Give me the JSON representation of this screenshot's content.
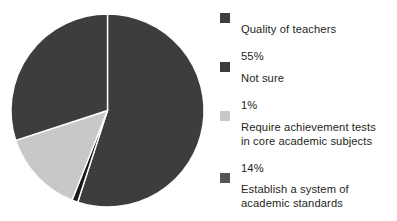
{
  "chart_data": {
    "type": "pie",
    "title": "",
    "subtitle": "",
    "xlabel": "",
    "ylabel": "",
    "legend_position": "right",
    "grid": false,
    "start_angle_deg": 0,
    "direction": "clockwise",
    "categories": [
      "Quality of teachers",
      "Not sure",
      "Require achievement tests in core academic subjects",
      "Establish a system of academic standards"
    ],
    "values": [
      55,
      1,
      14,
      30
    ],
    "value_labels": [
      "55%",
      "1%",
      "14%",
      "30%"
    ],
    "unit": "%",
    "total": 100,
    "colors": [
      "#3d3d3d",
      "#1a1a1a",
      "#c8c8c8",
      "#3d3d3d"
    ],
    "slice_separator_color": "#ffffff"
  },
  "legend": {
    "entries": [
      {
        "label": "Quality of teachers",
        "value": "55%",
        "color": "#3d3d3d",
        "swatch_name": "legend-swatch-quality-of-teachers"
      },
      {
        "label": "Not sure",
        "value": "1%",
        "color": "#3d3d3d",
        "swatch_name": "legend-swatch-not-sure"
      },
      {
        "label": "Require achievement tests\nin core academic subjects",
        "value": "14%",
        "color": "#c8c8c8",
        "swatch_name": "legend-swatch-require-achievement-tests"
      },
      {
        "label": "Establish a system of\nacademic standards",
        "value": "30%",
        "color": "#555555",
        "swatch_name": "legend-swatch-establish-system"
      }
    ]
  }
}
